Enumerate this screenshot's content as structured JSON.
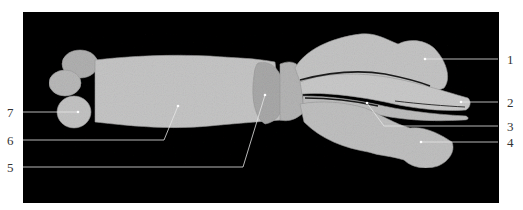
{
  "figure": {
    "background_color": "#000000",
    "specimen_color": "#bdbdbd",
    "labels": [
      {
        "id": 1,
        "text": "1"
      },
      {
        "id": 2,
        "text": "2"
      },
      {
        "id": 3,
        "text": "3"
      },
      {
        "id": 4,
        "text": "4"
      },
      {
        "id": 5,
        "text": "5"
      },
      {
        "id": 6,
        "text": "6"
      },
      {
        "id": 7,
        "text": "7"
      }
    ]
  }
}
